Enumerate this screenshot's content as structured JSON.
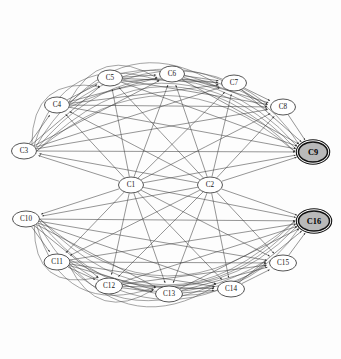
{
  "diagram": {
    "type": "directed-graph",
    "background_color": "#fdfdfd",
    "edge_color": "#3f3f3f",
    "node_fill": "#ffffff",
    "node_stroke": "#2a2a2a",
    "highlight_fill": "#b9b9b9",
    "highlight_stroke": "#111111",
    "node_count": 16,
    "edge_count": 96
  },
  "nodes": [
    {
      "id": "C1",
      "label": "C1",
      "x": 131,
      "y": 185,
      "rx": 12.5,
      "ry": 8.0,
      "highlight": false
    },
    {
      "id": "C2",
      "label": "C2",
      "x": 210,
      "y": 185,
      "rx": 12.5,
      "ry": 8.0,
      "highlight": false
    },
    {
      "id": "C3",
      "label": "C3",
      "x": 24,
      "y": 151,
      "rx": 12.5,
      "ry": 8.0,
      "highlight": false
    },
    {
      "id": "C4",
      "label": "C4",
      "x": 57,
      "y": 105,
      "rx": 12.5,
      "ry": 8.0,
      "highlight": false
    },
    {
      "id": "C5",
      "label": "C5",
      "x": 110,
      "y": 78,
      "rx": 12.5,
      "ry": 8.0,
      "highlight": false
    },
    {
      "id": "C6",
      "label": "C6",
      "x": 172,
      "y": 74,
      "rx": 12.5,
      "ry": 8.0,
      "highlight": false
    },
    {
      "id": "C7",
      "label": "C7",
      "x": 234,
      "y": 83,
      "rx": 12.5,
      "ry": 8.0,
      "highlight": false
    },
    {
      "id": "C8",
      "label": "C8",
      "x": 283,
      "y": 107,
      "rx": 12.5,
      "ry": 8.0,
      "highlight": false
    },
    {
      "id": "C9",
      "label": "C9",
      "x": 313,
      "y": 152,
      "rx": 14.5,
      "ry": 10.0,
      "highlight": true
    },
    {
      "id": "C10",
      "label": "C10",
      "x": 26,
      "y": 219,
      "rx": 13.5,
      "ry": 8.0,
      "highlight": false
    },
    {
      "id": "C11",
      "label": "C11",
      "x": 57,
      "y": 262,
      "rx": 13.0,
      "ry": 8.0,
      "highlight": false
    },
    {
      "id": "C12",
      "label": "C12",
      "x": 109,
      "y": 286,
      "rx": 13.5,
      "ry": 8.0,
      "highlight": false
    },
    {
      "id": "C13",
      "label": "C13",
      "x": 169,
      "y": 294,
      "rx": 13.5,
      "ry": 8.0,
      "highlight": false
    },
    {
      "id": "C14",
      "label": "C14",
      "x": 231,
      "y": 289,
      "rx": 13.5,
      "ry": 8.0,
      "highlight": false
    },
    {
      "id": "C15",
      "label": "C15",
      "x": 283,
      "y": 263,
      "rx": 13.5,
      "ry": 8.0,
      "highlight": false
    },
    {
      "id": "C16",
      "label": "C16",
      "x": 314,
      "y": 221,
      "rx": 15.5,
      "ry": 10.0,
      "highlight": true
    }
  ],
  "edges": [
    {
      "from": "C1",
      "to": "C5",
      "curve": 0
    },
    {
      "from": "C1",
      "to": "C6",
      "curve": 0
    },
    {
      "from": "C1",
      "to": "C7",
      "curve": 0
    },
    {
      "from": "C1",
      "to": "C8",
      "curve": 0
    },
    {
      "from": "C1",
      "to": "C9",
      "curve": 0
    },
    {
      "from": "C1",
      "to": "C4",
      "curve": 0
    },
    {
      "from": "C1",
      "to": "C3",
      "curve": 0
    },
    {
      "from": "C1",
      "to": "C10",
      "curve": 0
    },
    {
      "from": "C1",
      "to": "C11",
      "curve": 0
    },
    {
      "from": "C1",
      "to": "C12",
      "curve": 0
    },
    {
      "from": "C1",
      "to": "C13",
      "curve": 0
    },
    {
      "from": "C1",
      "to": "C14",
      "curve": 0
    },
    {
      "from": "C1",
      "to": "C15",
      "curve": 0
    },
    {
      "from": "C1",
      "to": "C16",
      "curve": 0
    },
    {
      "from": "C2",
      "to": "C5",
      "curve": 0
    },
    {
      "from": "C2",
      "to": "C6",
      "curve": 0
    },
    {
      "from": "C2",
      "to": "C7",
      "curve": 0
    },
    {
      "from": "C2",
      "to": "C8",
      "curve": 0
    },
    {
      "from": "C2",
      "to": "C9",
      "curve": 0
    },
    {
      "from": "C2",
      "to": "C4",
      "curve": 0
    },
    {
      "from": "C2",
      "to": "C3",
      "curve": 0
    },
    {
      "from": "C2",
      "to": "C10",
      "curve": 0
    },
    {
      "from": "C2",
      "to": "C11",
      "curve": 0
    },
    {
      "from": "C2",
      "to": "C12",
      "curve": 0
    },
    {
      "from": "C2",
      "to": "C13",
      "curve": 0
    },
    {
      "from": "C2",
      "to": "C14",
      "curve": 0
    },
    {
      "from": "C2",
      "to": "C15",
      "curve": 0
    },
    {
      "from": "C2",
      "to": "C16",
      "curve": 0
    },
    {
      "from": "C3",
      "to": "C4",
      "curve": 0
    },
    {
      "from": "C3",
      "to": "C5",
      "curve": 0
    },
    {
      "from": "C3",
      "to": "C6",
      "curve": 0
    },
    {
      "from": "C3",
      "to": "C7",
      "curve": 0
    },
    {
      "from": "C3",
      "to": "C8",
      "curve": 0
    },
    {
      "from": "C3",
      "to": "C9",
      "curve": 0
    },
    {
      "from": "C4",
      "to": "C5",
      "curve": 0
    },
    {
      "from": "C4",
      "to": "C6",
      "curve": 0
    },
    {
      "from": "C4",
      "to": "C7",
      "curve": 0
    },
    {
      "from": "C4",
      "to": "C8",
      "curve": 0
    },
    {
      "from": "C4",
      "to": "C9",
      "curve": 0
    },
    {
      "from": "C5",
      "to": "C6",
      "curve": 0
    },
    {
      "from": "C5",
      "to": "C7",
      "curve": 0
    },
    {
      "from": "C5",
      "to": "C8",
      "curve": 0
    },
    {
      "from": "C5",
      "to": "C9",
      "curve": 0
    },
    {
      "from": "C6",
      "to": "C7",
      "curve": 0
    },
    {
      "from": "C6",
      "to": "C8",
      "curve": 0
    },
    {
      "from": "C6",
      "to": "C9",
      "curve": 0
    },
    {
      "from": "C7",
      "to": "C8",
      "curve": 0
    },
    {
      "from": "C7",
      "to": "C9",
      "curve": 0
    },
    {
      "from": "C8",
      "to": "C9",
      "curve": 0
    },
    {
      "from": "C10",
      "to": "C11",
      "curve": 0
    },
    {
      "from": "C10",
      "to": "C12",
      "curve": 0
    },
    {
      "from": "C10",
      "to": "C13",
      "curve": 0
    },
    {
      "from": "C10",
      "to": "C14",
      "curve": 0
    },
    {
      "from": "C10",
      "to": "C15",
      "curve": 0
    },
    {
      "from": "C10",
      "to": "C16",
      "curve": 0
    },
    {
      "from": "C11",
      "to": "C12",
      "curve": 0
    },
    {
      "from": "C11",
      "to": "C13",
      "curve": 0
    },
    {
      "from": "C11",
      "to": "C14",
      "curve": 0
    },
    {
      "from": "C11",
      "to": "C15",
      "curve": 0
    },
    {
      "from": "C11",
      "to": "C16",
      "curve": 0
    },
    {
      "from": "C12",
      "to": "C13",
      "curve": 0
    },
    {
      "from": "C12",
      "to": "C14",
      "curve": 0
    },
    {
      "from": "C12",
      "to": "C15",
      "curve": 0
    },
    {
      "from": "C12",
      "to": "C16",
      "curve": 0
    },
    {
      "from": "C13",
      "to": "C14",
      "curve": 0
    },
    {
      "from": "C13",
      "to": "C15",
      "curve": 0
    },
    {
      "from": "C13",
      "to": "C16",
      "curve": 0
    },
    {
      "from": "C14",
      "to": "C15",
      "curve": 0
    },
    {
      "from": "C14",
      "to": "C16",
      "curve": 0
    },
    {
      "from": "C15",
      "to": "C16",
      "curve": 0
    }
  ],
  "long_edges": [
    {
      "from": "C3",
      "to": "C5",
      "bow": -52
    },
    {
      "from": "C3",
      "to": "C6",
      "bow": -72
    },
    {
      "from": "C3",
      "to": "C7",
      "bow": -88
    },
    {
      "from": "C3",
      "to": "C8",
      "bow": -100
    },
    {
      "from": "C3",
      "to": "C9",
      "bow": -112
    },
    {
      "from": "C4",
      "to": "C6",
      "bow": -48
    },
    {
      "from": "C4",
      "to": "C7",
      "bow": -62
    },
    {
      "from": "C4",
      "to": "C8",
      "bow": -74
    },
    {
      "from": "C4",
      "to": "C9",
      "bow": -86
    },
    {
      "from": "C5",
      "to": "C8",
      "bow": -40
    },
    {
      "from": "C5",
      "to": "C9",
      "bow": -52
    },
    {
      "from": "C6",
      "to": "C9",
      "bow": -38
    },
    {
      "from": "C10",
      "to": "C12",
      "bow": 52
    },
    {
      "from": "C10",
      "to": "C13",
      "bow": 72
    },
    {
      "from": "C10",
      "to": "C14",
      "bow": 88
    },
    {
      "from": "C10",
      "to": "C15",
      "bow": 100
    },
    {
      "from": "C10",
      "to": "C16",
      "bow": 112
    },
    {
      "from": "C11",
      "to": "C13",
      "bow": 48
    },
    {
      "from": "C11",
      "to": "C14",
      "bow": 62
    },
    {
      "from": "C11",
      "to": "C15",
      "bow": 74
    },
    {
      "from": "C11",
      "to": "C16",
      "bow": 86
    },
    {
      "from": "C12",
      "to": "C15",
      "bow": 40
    },
    {
      "from": "C12",
      "to": "C16",
      "bow": 52
    },
    {
      "from": "C13",
      "to": "C16",
      "bow": 38
    },
    {
      "from": "C3",
      "to": "C9",
      "bow": -130
    },
    {
      "from": "C10",
      "to": "C16",
      "bow": 130
    }
  ]
}
